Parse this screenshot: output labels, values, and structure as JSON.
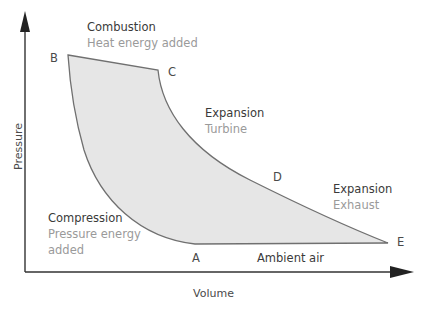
{
  "diagram": {
    "type": "pressure-volume cycle (Brayton cycle)",
    "axes": {
      "x_label": "Volume",
      "y_label": "Pressure"
    },
    "points": {
      "A": "A",
      "B": "B",
      "C": "C",
      "D": "D",
      "E": "E"
    },
    "stages": {
      "combustion": {
        "title": "Combustion",
        "subtitle": "Heat energy added"
      },
      "expansion_turbine": {
        "title": "Expansion",
        "subtitle": "Turbine"
      },
      "expansion_exhaust": {
        "title": "Expansion",
        "subtitle": "Exhaust"
      },
      "compression": {
        "title": "Compression",
        "subtitle_line1": "Pressure energy",
        "subtitle_line2": "added"
      },
      "ambient": {
        "title": "Ambient air"
      }
    },
    "colors": {
      "fill": "#e6e6e6",
      "outline": "#707070",
      "axis": "#333333",
      "title_text": "#3a3a3a",
      "subtitle_text": "#9a9a9a"
    }
  }
}
